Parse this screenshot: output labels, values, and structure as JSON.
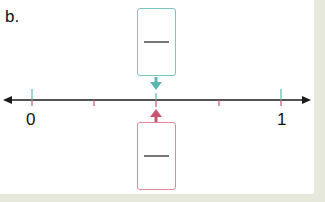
{
  "problem": {
    "label": "b.",
    "number_line": {
      "start_label": "0",
      "end_label": "1",
      "divisions": 4,
      "arrow_position": "1/2"
    },
    "top_box": {
      "type": "fraction-input",
      "numerator": "",
      "denominator": "",
      "color": "#5bb5b0"
    },
    "bottom_box": {
      "type": "fraction-input",
      "numerator": "",
      "denominator": "",
      "color": "#c9566e"
    }
  },
  "colors": {
    "teal": "#5bb5b0",
    "pink": "#c9566e",
    "line": "#1a1a1a",
    "background": "#e6e8dc"
  }
}
